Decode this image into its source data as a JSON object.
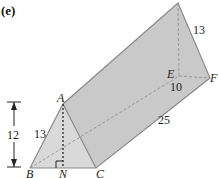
{
  "figure": {
    "part_label": "(e)",
    "shape": "triangular prism",
    "colors": {
      "face_fill": "#c9c9c9",
      "front_fill": "#d6d6d6",
      "edge": "#8a8a8a",
      "hidden": "#9a9a9a",
      "text": "#222222"
    },
    "vertices": {
      "A": "A",
      "B": "B",
      "C": "C",
      "N": "N",
      "E": "E",
      "F": "F"
    },
    "measurements": {
      "height": "12",
      "AB": "13",
      "DF": "13",
      "EF": "10",
      "length": "25"
    }
  }
}
